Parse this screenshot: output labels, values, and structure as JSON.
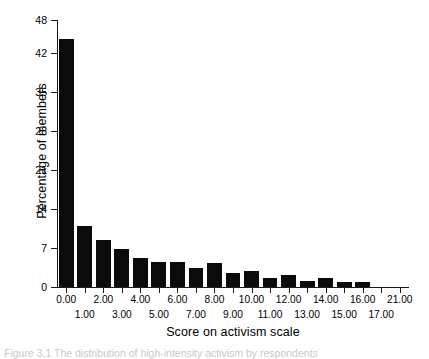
{
  "figure": {
    "caption": "Figure 3.1  The distribution of high-intensity activism by respondents"
  },
  "chart_data": {
    "type": "bar",
    "title": "",
    "subtitle": "",
    "xlabel": "Score on activism scale",
    "ylabel": "Percentage of members",
    "grid": false,
    "legend": false,
    "legend_position": "none",
    "bar_color": "#0b0b0b",
    "xlim": [
      -0.5,
      18.5
    ],
    "ylim": [
      0,
      48
    ],
    "yticks": [
      0,
      7,
      14,
      21,
      28,
      35,
      42,
      48
    ],
    "ytick_labels": [
      "0",
      "7",
      "14",
      "21",
      "28",
      "35",
      "42",
      "48"
    ],
    "xtick_labels_upper": [
      "0.00",
      "2.00",
      "4.00",
      "6.00",
      "8.00",
      "10.00",
      "12.00",
      "14.00",
      "16.00",
      "21.00"
    ],
    "xtick_labels_lower": [
      "1.00",
      "3.00",
      "5.00",
      "7.00",
      "9.00",
      "11.00",
      "13.00",
      "15.00",
      "17.00"
    ],
    "categories": [
      "0.00",
      "1.00",
      "2.00",
      "3.00",
      "4.00",
      "5.00",
      "6.00",
      "7.00",
      "8.00",
      "9.00",
      "10.00",
      "11.00",
      "12.00",
      "13.00",
      "14.00",
      "15.00",
      "16.00",
      "17.00",
      "21.00"
    ],
    "values": [
      44.5,
      10.9,
      8.4,
      6.8,
      5.3,
      4.5,
      4.5,
      3.4,
      4.4,
      2.6,
      2.8,
      1.6,
      2.2,
      1.0,
      1.7,
      0.9,
      0.9,
      0.0,
      0.0
    ]
  }
}
